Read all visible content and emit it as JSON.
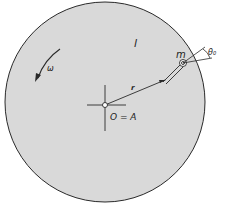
{
  "diagram": {
    "labels": {
      "body": "l",
      "omega": "ω",
      "radius": "r",
      "mass": "m",
      "angle": "θ₀",
      "origin": "O = A"
    },
    "colors": {
      "disk_fill": "#d9d9d9",
      "stroke": "#2a2a2a"
    }
  }
}
